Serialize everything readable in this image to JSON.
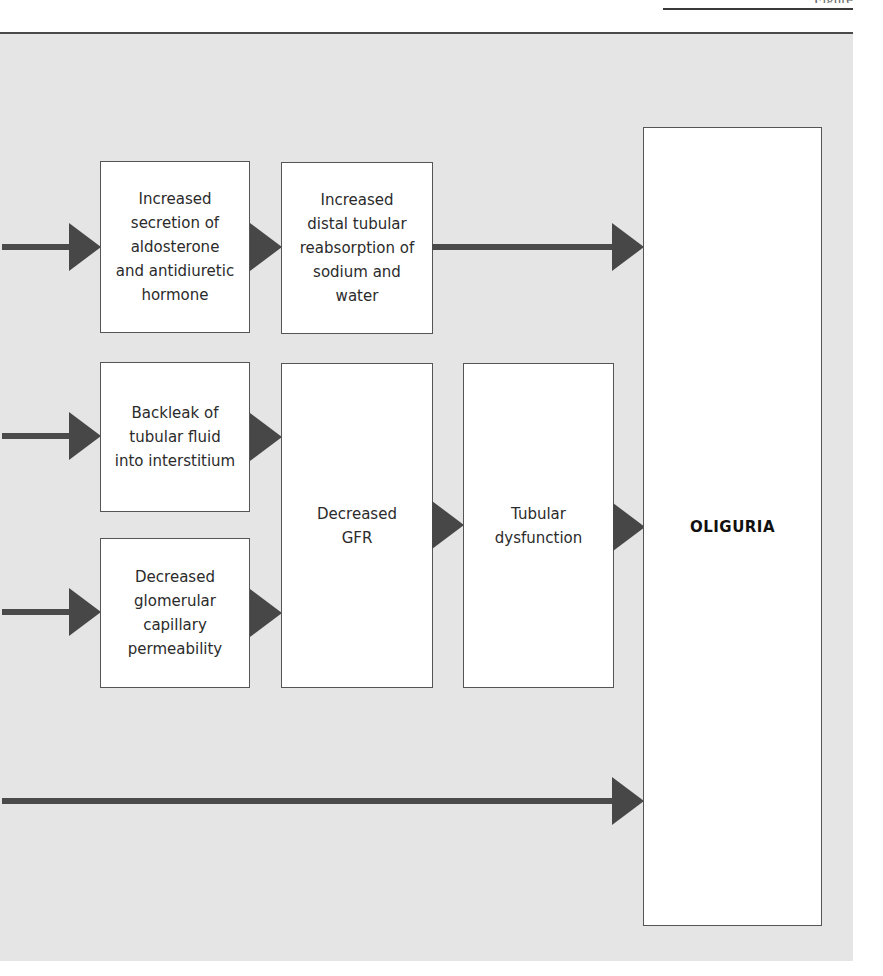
{
  "header": {
    "running_head": "Figure"
  },
  "diagram": {
    "colors": {
      "panel_background": "#e5e5e5",
      "arrow": "#4a4a4a",
      "box_border": "#555555",
      "box_fill": "#ffffff"
    },
    "nodes": {
      "aldosterone_adh": "Increased secretion of aldosterone and antidiuretic hormone",
      "distal_reabsorption": "Increased distal tubular reabsorption of sodium and water",
      "backleak": "Backleak of tubular fluid into interstitium",
      "glomerular_permeability": "Decreased glomerular capillary permeability",
      "decreased_gfr": "Decreased GFR",
      "tubular_dysfunction": "Tubular dysfunction",
      "oliguria": "OLIGURIA"
    },
    "lines": {
      "aldosterone_adh": [
        "Increased",
        "secretion of",
        "aldosterone",
        "and antidiuretic",
        "hormone"
      ],
      "distal_reabsorption": [
        "Increased",
        "distal tubular",
        "reabsorption of",
        "sodium and",
        "water"
      ],
      "backleak": [
        "Backleak of",
        "tubular fluid",
        "into interstitium"
      ],
      "glomerular_permeability": [
        "Decreased",
        "glomerular",
        "capillary",
        "permeability"
      ],
      "decreased_gfr": [
        "Decreased",
        "GFR"
      ],
      "tubular_dysfunction": [
        "Tubular",
        "dysfunction"
      ],
      "oliguria": [
        "OLIGURIA"
      ]
    },
    "edges": [
      {
        "from": "(off-page left)",
        "to": "aldosterone_adh"
      },
      {
        "from": "aldosterone_adh",
        "to": "distal_reabsorption"
      },
      {
        "from": "distal_reabsorption",
        "to": "oliguria"
      },
      {
        "from": "(off-page left)",
        "to": "backleak"
      },
      {
        "from": "backleak",
        "to": "decreased_gfr"
      },
      {
        "from": "(off-page left)",
        "to": "glomerular_permeability"
      },
      {
        "from": "glomerular_permeability",
        "to": "decreased_gfr"
      },
      {
        "from": "decreased_gfr",
        "to": "tubular_dysfunction"
      },
      {
        "from": "tubular_dysfunction",
        "to": "oliguria"
      },
      {
        "from": "(off-page left)",
        "to": "oliguria"
      }
    ]
  }
}
